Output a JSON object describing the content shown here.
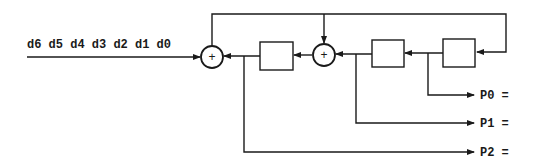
{
  "diagram": {
    "type": "linear feedback shift register (polynomial division circuit)",
    "input": {
      "label": "d6 d5 d4 d3 d2 d1 d0",
      "bits": [
        "d6",
        "d5",
        "d4",
        "d3",
        "d2",
        "d1",
        "d0"
      ]
    },
    "adders": [
      {
        "id": "xor-left",
        "symbol": "+"
      },
      {
        "id": "xor-middle",
        "symbol": "+"
      }
    ],
    "registers": [
      {
        "id": "register-2",
        "label": ""
      },
      {
        "id": "register-1",
        "label": ""
      },
      {
        "id": "register-0",
        "label": ""
      }
    ],
    "outputs": [
      {
        "id": "p0",
        "label": "P0 ="
      },
      {
        "id": "p1",
        "label": "P1 ="
      },
      {
        "id": "p2",
        "label": "P2 ="
      }
    ],
    "colors": {
      "line": "#1a1a1a",
      "background": "#ffffff"
    }
  }
}
